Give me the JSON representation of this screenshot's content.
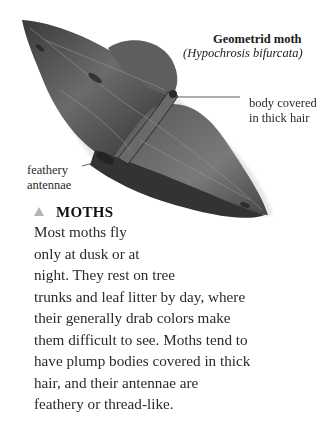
{
  "figure": {
    "title": "Geometrid moth",
    "scientific_name": "(Hypochrosis bifurcata)"
  },
  "annotations": [
    {
      "id": "body",
      "lines": [
        "body covered",
        "in thick hair"
      ]
    },
    {
      "id": "antennae",
      "lines": [
        "feathery",
        "antennae"
      ]
    }
  ],
  "section": {
    "marker": "triangle-icon",
    "marker_color": "#b5b5b5",
    "heading": "MOTHS",
    "lines": [
      "Most moths fly",
      "only at dusk or at",
      "night. They rest on tree",
      "trunks and leaf litter by day, where",
      "their generally drab colors make",
      "them difficult to see. Moths tend to",
      "have plump bodies covered in thick",
      "hair, and their antennae are",
      "feathery or thread-like."
    ]
  }
}
